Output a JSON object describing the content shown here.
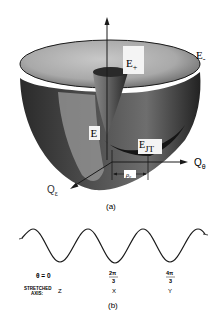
{
  "figure": {
    "panel_a": {
      "caption": "(a)",
      "labels": {
        "e_plus": "E",
        "e_plus_sub": "+",
        "e_minus": "E",
        "e_minus_sub": "-",
        "e": "E",
        "e_jt": "E",
        "e_jt_sub": "JT",
        "q_theta": "Q",
        "q_theta_sub": "θ",
        "q_epsilon": "Q",
        "q_epsilon_sub": "ε",
        "rho0": "ρ₀"
      }
    },
    "panel_b": {
      "caption": "(b)",
      "theta_label": "θ = 0",
      "tick_2pi3_num": "2π",
      "tick_2pi3_den": "3",
      "tick_4pi3_num": "4π",
      "tick_4pi3_den": "3",
      "stretched_label_line1": "STRETCHED",
      "stretched_label_line2": "AXIS:",
      "axes": [
        "Z",
        "X",
        "Y"
      ]
    }
  },
  "colors": {
    "ink": "#1a1a1a",
    "surface_light": "#bdbdbd",
    "surface_mid": "#7a7a7a",
    "surface_dark": "#1e1e1e",
    "paper": "#ffffff"
  }
}
